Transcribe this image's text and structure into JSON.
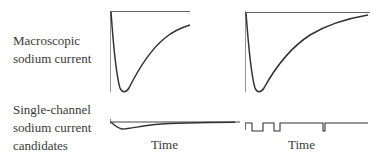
{
  "rows": {
    "macroscopic": {
      "label_lines": [
        "Macroscopic",
        "sodium current"
      ]
    },
    "single_channel": {
      "label_lines": [
        "Single-channel",
        "sodium current",
        "candidates"
      ]
    }
  },
  "x_axis_labels": {
    "left": "Time",
    "right": "Time"
  },
  "panels": [
    {
      "id": "left",
      "macroscopic_trace": "fast inward transient with exponential recovery",
      "single_channel_trace": "smooth small-amplitude miniature of macroscopic current"
    },
    {
      "id": "right",
      "macroscopic_trace": "fast inward transient with exponential recovery",
      "single_channel_trace": "discrete rectangular openings (3 events)"
    }
  ],
  "colors": {
    "stroke": "#333333",
    "text": "#3a3a3a",
    "background": "#ffffff"
  }
}
